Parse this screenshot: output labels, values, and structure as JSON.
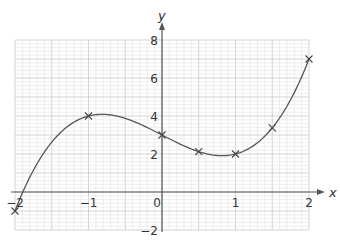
{
  "chart_data": {
    "type": "line",
    "title": "",
    "xlabel": "x",
    "ylabel": "y",
    "xlim": [
      -2,
      2
    ],
    "ylim": [
      -2,
      8
    ],
    "grid": true,
    "function": "y = x^3 - 2x + 3",
    "x_ticks": [
      "-2",
      "-1",
      "0",
      "1",
      "2"
    ],
    "y_ticks": [
      "-2",
      "2",
      "4",
      "6",
      "8"
    ],
    "series": [
      {
        "name": "curve",
        "x": [
          -2,
          -1,
          0,
          0.5,
          1,
          1.5,
          2
        ],
        "y": [
          -1,
          4,
          3,
          2.125,
          2,
          3.375,
          7
        ],
        "marker": "x"
      }
    ]
  },
  "axes": {
    "x_label": "x",
    "y_label": "y",
    "x_tick_labels": [
      "−2",
      "−1",
      "0",
      "1",
      "2"
    ],
    "y_tick_labels": [
      "−2",
      "2",
      "4",
      "6",
      "8"
    ]
  },
  "colors": {
    "grid_minor": "#e2e2e2",
    "grid_major": "#c8c8c8",
    "axis": "#555555",
    "curve": "#555555"
  }
}
